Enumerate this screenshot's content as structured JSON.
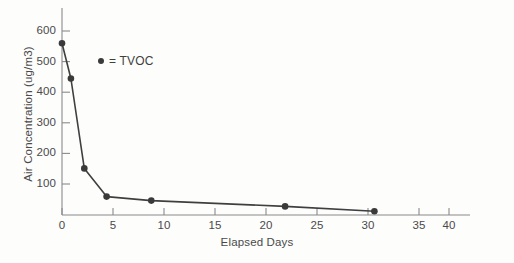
{
  "chart_data": {
    "type": "line",
    "title": "",
    "subtitle": "",
    "xlabel": "Elapsed Days",
    "ylabel": "Air Concentration (ug/m3)",
    "xlim": [
      0,
      41.5
    ],
    "ylim": [
      0,
      640
    ],
    "xticks": [
      0,
      5,
      10,
      15,
      20,
      25,
      30,
      35,
      40
    ],
    "xticklabels": [
      "0",
      "5",
      "10",
      "15",
      "20",
      "25",
      "30",
      "35",
      "40"
    ],
    "yticks": [
      100,
      200,
      300,
      400,
      500,
      600
    ],
    "yticklabels": [
      "100",
      "200",
      "300",
      "400",
      "500",
      "600"
    ],
    "grid": false,
    "legend_position": "upper-left-inside",
    "series": [
      {
        "name": "TVOC",
        "legend_label": "= TVOC",
        "marker": "circle",
        "color": "#3a3a3a",
        "x": [
          0,
          1,
          2.5,
          5,
          10,
          25,
          35
        ],
        "values": [
          560,
          445,
          152,
          60,
          47,
          28,
          12
        ]
      }
    ]
  },
  "legend": {
    "marker_name": "tvoc-marker-dot",
    "label": "= TVOC"
  },
  "axes": {
    "y_title": "Air Concentration (ug/m3)",
    "x_title": "Elapsed Days"
  }
}
